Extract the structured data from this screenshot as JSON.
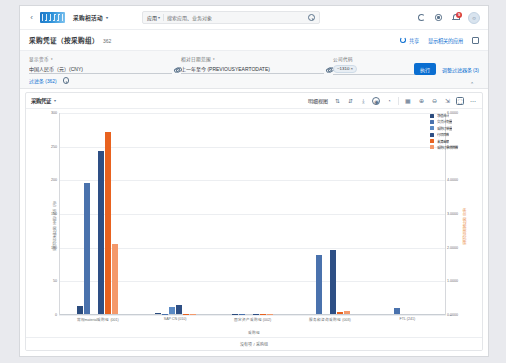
{
  "shell": {
    "back_icon": "chevron-left-icon",
    "logo_text": "SAP",
    "app_title": "采购相活动",
    "app_title_caret": "▾",
    "search": {
      "scope": "应用",
      "scope_caret": "▾",
      "placeholder": "搜索应用、业务对象",
      "value": "搜索应用、业务对象",
      "icon": "search-icon"
    },
    "icons": [
      {
        "name": "refresh-icon",
        "glyph": ""
      },
      {
        "name": "gear-icon",
        "glyph": ""
      },
      {
        "name": "notifications-bell-icon",
        "glyph": "",
        "badge": "9"
      }
    ],
    "avatar": {
      "name": "user-avatar",
      "glyph": "☺"
    }
  },
  "page": {
    "title": "采购凭证（按采购组）",
    "count": "362",
    "actions": [
      {
        "name": "share-action",
        "label": "共享",
        "icon": "share-icon"
      },
      {
        "name": "show-related-apps-action",
        "label": "显示相关的应用",
        "icon": "related-apps-icon"
      },
      {
        "name": "fullscreen-action",
        "label": "",
        "icon": "fullscreen-icon"
      }
    ]
  },
  "filterbar": {
    "filters": [
      {
        "name": "display-currency",
        "label": "显示货币",
        "label_caret": "▾",
        "value": "中国人民币（元）(CNY)",
        "valuehelp_icon": "value-help-icon"
      },
      {
        "name": "relative-date-range",
        "label": "相对日期范围",
        "label_caret": "▾",
        "value": "上一年至今 (PREVIOUSYEARTODATE)",
        "valuehelp_icon": "value-help-icon"
      },
      {
        "name": "company-code",
        "label": "公司代码",
        "label_caret": "",
        "value": "~1310 ×",
        "valuehelp_icon": "value-help-icon"
      }
    ],
    "more_filters_link": "过滤条 (362)",
    "filter_settings_icon": "filter-settings-icon",
    "go_button": "执行",
    "adapt_filters_link": "调整过滤器条 (3)",
    "collapse_icon": "chevron-up-icon"
  },
  "chart": {
    "view_selector": "采购凭证",
    "view_caret": "▾",
    "toolbar_label": "明细视图",
    "toolbar_icons": [
      {
        "name": "sort-ascending-icon",
        "glyph": "⇅"
      },
      {
        "name": "sort-descending-icon",
        "glyph": "⇵"
      },
      {
        "name": "drill-down-icon",
        "glyph": "⤓"
      },
      {
        "name": "chart-type-icon",
        "glyph": "◉"
      },
      {
        "name": "measure-icon",
        "glyph": "◔"
      },
      {
        "name": "dimension-icon",
        "glyph": "▦"
      },
      {
        "name": "zoom-in-icon",
        "glyph": "⊕"
      },
      {
        "name": "zoom-out-icon",
        "glyph": "⊖"
      },
      {
        "name": "legend-toggle-icon",
        "glyph": "⇲"
      },
      {
        "name": "settings-icon",
        "glyph": "⚙"
      },
      {
        "name": "fullscreen-toggle-icon",
        "glyph": "⛶"
      },
      {
        "name": "more-actions-icon",
        "glyph": "⋯"
      }
    ],
    "footer_text": "没有项 / 采购组"
  },
  "chart_data": {
    "type": "bar",
    "title": "采购凭证",
    "xlabel": "采购组",
    "ylabel": "采购凭证净值之和（中国人民币（元））",
    "ylabel_right": "采购凭证项目数之和（比率）",
    "grid": true,
    "legend_position": "right",
    "ylim": [
      0,
      300
    ],
    "yticks": [
      0,
      50,
      100,
      150,
      200,
      250,
      300
    ],
    "ytick_labels": [
      "0",
      "50",
      "100",
      "150",
      "200",
      "250",
      "300"
    ],
    "ylim_right": [
      0.0,
      6e-05
    ],
    "yticks_right": [
      0.0,
      1e-05,
      2e-05,
      3e-05,
      4e-05,
      5e-05,
      6e-05
    ],
    "ytick_labels_right": [
      "0.0000",
      "1.0000",
      "2.0000",
      "3.0000",
      "4.0000",
      "5.0000",
      "6.0000"
    ],
    "categories": [
      "常规material采购组 (001)",
      "SAP CN (010)",
      "固定资产采购组 (002)",
      "服务和咨询采购组 (003)",
      "FTL (241)"
    ],
    "series": [
      {
        "name": "净值合计",
        "color": "#2b4c7e",
        "values": [
          12,
          2,
          0.6,
          0,
          0
        ]
      },
      {
        "name": "交货计划量",
        "color": "#4a72ad",
        "values": [
          196,
          0.5,
          0.4,
          88,
          9
        ]
      },
      {
        "name": "采购订单量",
        "color": "#5b8ac4",
        "values": [
          0,
          11,
          0,
          0,
          0
        ]
      },
      {
        "name": "行项目数",
        "color": "#2e4f85",
        "values": [
          244,
          13,
          0.5,
          95,
          0
        ]
      },
      {
        "name": "未清金额",
        "color": "#e8621f",
        "values": [
          272,
          0.4,
          0.7,
          3,
          0
        ]
      },
      {
        "name": "采购订单项目数",
        "color": "#f4996b",
        "values": [
          104,
          0.3,
          0.5,
          5,
          0
        ]
      }
    ]
  }
}
